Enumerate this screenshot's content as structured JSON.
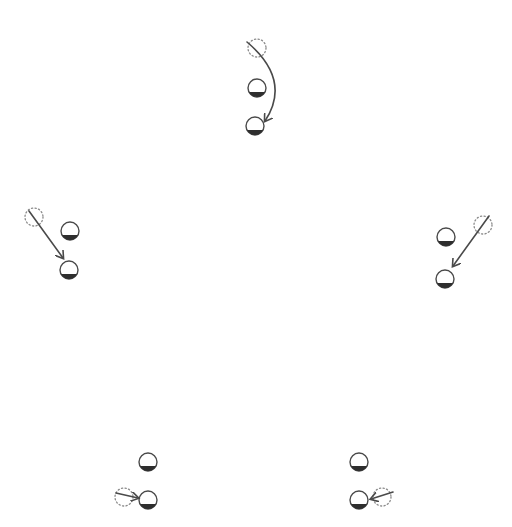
{
  "diagram": {
    "colors": {
      "stroke": "#4a4a4a",
      "shadow": "#2e2e2e",
      "dotted": "#8a8a8a",
      "background": "#ffffff"
    },
    "groups": [
      {
        "id": "top",
        "ghost": {
          "cx": 257,
          "cy": 48
        },
        "balls": [
          {
            "cx": 257,
            "cy": 88
          },
          {
            "cx": 255,
            "cy": 126
          }
        ],
        "arrow": {
          "type": "curve",
          "path": "M247 42 Q 292 80 265 121"
        }
      },
      {
        "id": "left",
        "ghost": {
          "cx": 34,
          "cy": 217
        },
        "balls": [
          {
            "cx": 70,
            "cy": 231
          },
          {
            "cx": 69,
            "cy": 270
          }
        ],
        "arrow": {
          "type": "line",
          "path": "M29 211 L 63 258"
        }
      },
      {
        "id": "right",
        "ghost": {
          "cx": 483,
          "cy": 225
        },
        "balls": [
          {
            "cx": 446,
            "cy": 237
          },
          {
            "cx": 445,
            "cy": 279
          }
        ],
        "arrow": {
          "type": "line",
          "path": "M489 216 L 453 266"
        }
      },
      {
        "id": "bottom-left",
        "ghost": {
          "cx": 124,
          "cy": 497
        },
        "balls": [
          {
            "cx": 148,
            "cy": 462
          },
          {
            "cx": 148,
            "cy": 500
          }
        ],
        "arrow": {
          "type": "line",
          "path": "M116 493 L 138 498"
        }
      },
      {
        "id": "bottom-right",
        "ghost": {
          "cx": 382,
          "cy": 497
        },
        "balls": [
          {
            "cx": 359,
            "cy": 462
          },
          {
            "cx": 359,
            "cy": 500
          }
        ],
        "arrow": {
          "type": "line",
          "path": "M393 492 L 371 499"
        }
      }
    ],
    "ball_radius": 9,
    "ghost_radius": 9
  }
}
